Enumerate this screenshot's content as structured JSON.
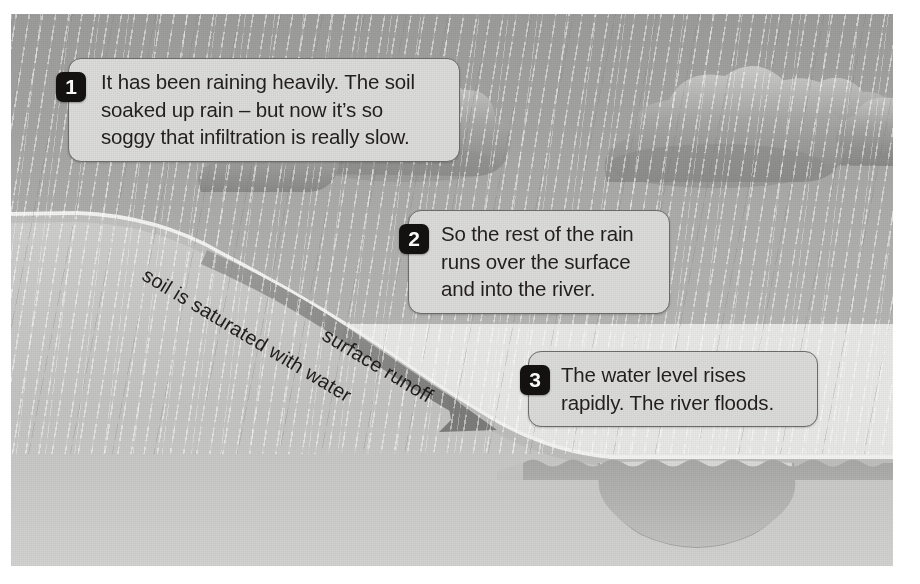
{
  "figure": {
    "background_color": "#ffffff",
    "panel_color": "#e9e9e7"
  },
  "colors": {
    "sky": "#a6a6a4",
    "cloud": "#9a9a98",
    "cloud_highlight": "#c9c9c7",
    "ground": "#c2c2c0",
    "ground_light": "#d6d6d4",
    "water": "#b3b3b1",
    "callout_fill": "#dcdcda",
    "callout_border": "#6e6e6c",
    "badge_fill": "#141210",
    "badge_text": "#ffffff",
    "arrow": "#8e8e8c",
    "text": "#231f1e"
  },
  "callouts": [
    {
      "number": "1",
      "lines": [
        "It has been raining heavily. The soil",
        "soaked up rain – but now it’s so",
        "soggy that infiltration is really slow."
      ]
    },
    {
      "number": "2",
      "lines": [
        "So the rest of the rain",
        "runs over the surface",
        "and into the river."
      ]
    },
    {
      "number": "3",
      "lines": [
        "The water level rises",
        "rapidly. The river floods."
      ]
    }
  ],
  "ground_labels": [
    {
      "id": "saturated",
      "text": "soil is saturated with water"
    },
    {
      "id": "runoff",
      "text": "surface runoff"
    }
  ],
  "scene_elements": [
    {
      "name": "rain-clouds",
      "description": "Bank of grey cumulus clouds across the upper sky"
    },
    {
      "name": "rain-streaks",
      "description": "Heavy slanted rainfall filling the sky"
    },
    {
      "name": "hillside",
      "description": "Saturated soil slope descending left to right"
    },
    {
      "name": "runoff-arrow",
      "description": "Tapered grey arrow running down the slope into the river"
    },
    {
      "name": "river-channel",
      "description": "U-shaped river channel on the right"
    },
    {
      "name": "flood-water",
      "description": "Risen water with wavy surface overtopping the banks"
    }
  ]
}
